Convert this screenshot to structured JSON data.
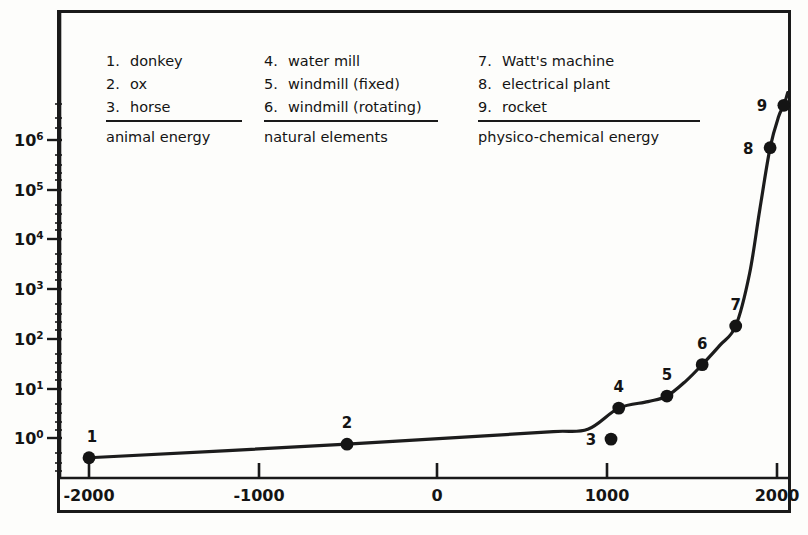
{
  "chart_data": {
    "type": "line",
    "title": "",
    "xlabel": "",
    "ylabel": "",
    "yscale": "log",
    "xlim": [
      -2200,
      2120
    ],
    "ylim": [
      0.25,
      13000000
    ],
    "grid": false,
    "legend_position": "top-inside",
    "x_ticks": [
      "-2000",
      "-1000",
      "0",
      "1000",
      "2000"
    ],
    "x_tick_values": [
      -2000,
      -1000,
      0,
      1000,
      2000
    ],
    "y_ticks": [
      "10^0",
      "10^1",
      "10^2",
      "10^3",
      "10^4",
      "10^5",
      "10^6"
    ],
    "y_tick_values": [
      1,
      10,
      100,
      1000,
      10000,
      100000,
      1000000
    ],
    "y_tick_base": "10",
    "y_tick_exponents": [
      "0",
      "1",
      "2",
      "3",
      "4",
      "5",
      "6"
    ],
    "series": [
      {
        "name": "energy per machine",
        "points": [
          {
            "label": "1",
            "x": -2000,
            "y": 0.4
          },
          {
            "label": "2",
            "x": -500,
            "y": 0.75
          },
          {
            "label": "3",
            "x": 1035,
            "y": 0.95
          },
          {
            "label": "4",
            "x": 1080,
            "y": 4
          },
          {
            "label": "5",
            "x": 1360,
            "y": 7
          },
          {
            "label": "6",
            "x": 1565,
            "y": 30
          },
          {
            "label": "7",
            "x": 1760,
            "y": 180
          },
          {
            "label": "8",
            "x": 1960,
            "y": 700000
          },
          {
            "label": "9",
            "x": 2040,
            "y": 5000000
          }
        ]
      }
    ],
    "curve_x": [
      -2000,
      -500,
      300,
      700,
      900,
      1080,
      1250,
      1360,
      1470,
      1565,
      1670,
      1760,
      1840,
      1900,
      1960,
      2010,
      2040,
      2062
    ],
    "curve_y": [
      0.4,
      0.75,
      1.1,
      1.35,
      1.5,
      4.0,
      5.4,
      7.0,
      14,
      30,
      75,
      180,
      2000,
      40000,
      700000,
      3000000,
      5000000,
      9000000
    ]
  },
  "legend": {
    "columns": [
      {
        "category": "animal energy",
        "items": [
          {
            "num": "1.",
            "label": "donkey"
          },
          {
            "num": "2.",
            "label": "ox"
          },
          {
            "num": "3.",
            "label": "horse"
          }
        ]
      },
      {
        "category": "natural elements",
        "items": [
          {
            "num": "4.",
            "label": "water mill"
          },
          {
            "num": "5.",
            "label": "windmill (fixed)"
          },
          {
            "num": "6.",
            "label": "windmill (rotating)"
          }
        ]
      },
      {
        "category": "physico-chemical energy",
        "items": [
          {
            "num": "7.",
            "label": "Watt's machine"
          },
          {
            "num": "8.",
            "label": "electrical plant"
          },
          {
            "num": "9.",
            "label": "rocket"
          }
        ]
      }
    ]
  },
  "colors": {
    "ink": "#141414",
    "background": "#fdfdfb",
    "frame": "#1a1a1a",
    "curve": "#1c1c1c",
    "marker": "#141414"
  }
}
